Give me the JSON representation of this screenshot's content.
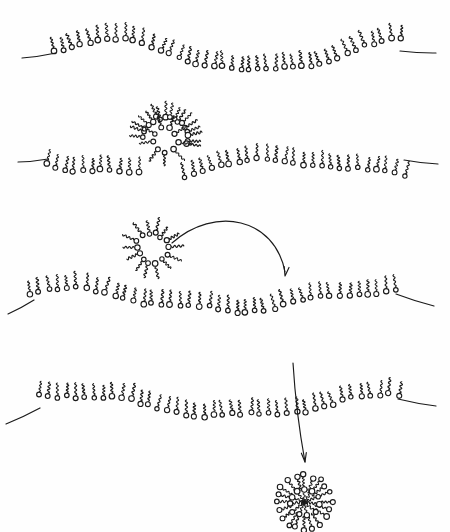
{
  "figure": {
    "type": "hand-drawn-schematic",
    "background_color": "#fefefe",
    "ink_color": "#1a1a1a",
    "width": 450,
    "height": 532,
    "panel_count": 4
  },
  "style": {
    "head_radius": 2.5,
    "tail_length": 11,
    "tail_wave_amplitude": 2.1,
    "tail_wave_count": 3,
    "stroke_width": 1.15,
    "end_line_width": 1.2
  },
  "panels": [
    {
      "name": "panel-1-undulating-monolayer",
      "label": "Undulating lipid monolayer",
      "membrane": {
        "name": "monolayer-1",
        "lipid_count": 40,
        "x_start": 54,
        "x_end": 400,
        "baseline": 56,
        "tails_up": true,
        "waves": [
          {
            "amp": -15,
            "phase": 0.45,
            "cycles": 1.15
          },
          {
            "amp": 3.0,
            "phase": 1.4,
            "cycles": 2.6
          }
        ],
        "left_end_line": {
          "x1": 22,
          "y1": 58,
          "x2": 56,
          "y2": 53
        },
        "right_end_line": {
          "x1": 400,
          "y1": 51,
          "x2": 436,
          "y2": 53
        }
      },
      "micelle": null,
      "arrow": null
    },
    {
      "name": "panel-2-micelle-inserting",
      "label": "Micelle splaying into the monolayer",
      "membrane": {
        "name": "monolayer-2",
        "lipid_count": 40,
        "x_start": 46,
        "x_end": 404,
        "baseline": 168,
        "tails_up": true,
        "waves": [
          {
            "amp": -7.5,
            "phase": 2.35,
            "cycles": 1.35
          },
          {
            "amp": 3.5,
            "phase": 0.7,
            "cycles": 2.9
          }
        ],
        "gap_from": 0.26,
        "gap_to": 0.36,
        "left_end_line": {
          "x1": 18,
          "y1": 162,
          "x2": 48,
          "y2": 159
        },
        "right_end_line": {
          "x1": 404,
          "y1": 160,
          "x2": 438,
          "y2": 164
        }
      },
      "micelle": {
        "name": "micelle-inserting",
        "shape": "splayed-wedge",
        "cx": 165,
        "cy": 140,
        "radius": 23,
        "lipid_count": 17,
        "heads_inward": true,
        "angle_start": -170,
        "angle_end": 10
      },
      "arrow": null
    },
    {
      "name": "panel-3-micelle-approaching",
      "label": "Free micelle with curved arrow toward monolayer",
      "membrane": {
        "name": "monolayer-3",
        "lipid_count": 40,
        "x_start": 30,
        "x_end": 396,
        "baseline": 300,
        "tails_up": true,
        "waves": [
          {
            "amp": -10,
            "phase": 1.15,
            "cycles": 1.05
          },
          {
            "amp": 3.0,
            "phase": 2.2,
            "cycles": 3.1
          }
        ],
        "left_end_line": {
          "x1": 8,
          "y1": 314,
          "x2": 34,
          "y2": 300
        },
        "right_end_line": {
          "x1": 396,
          "y1": 294,
          "x2": 434,
          "y2": 306
        }
      },
      "micelle": {
        "name": "micelle-free-upper",
        "shape": "radial",
        "cx": 152,
        "cy": 248,
        "radius": 15,
        "lipid_count": 14,
        "heads_inward": true,
        "angle_start": 0,
        "angle_end": 360
      },
      "arrow": {
        "name": "curved-arrow-micelle-to-membrane",
        "kind": "curved",
        "path": "M 172 243 C 215 205, 275 218, 285 272",
        "head_angle_deg": 100,
        "head_x": 285,
        "head_y": 276
      }
    },
    {
      "name": "panel-4-monolayer-shedding-micelle",
      "label": "Monolayer with downward arrow releasing a micelle",
      "membrane": {
        "name": "monolayer-4",
        "lipid_count": 40,
        "x_start": 38,
        "x_end": 398,
        "baseline": 405,
        "tails_up": true,
        "waves": [
          {
            "amp": -11,
            "phase": 1.3,
            "cycles": 1.0
          },
          {
            "amp": 2.6,
            "phase": 0.2,
            "cycles": 3.0
          }
        ],
        "left_end_line": {
          "x1": 6,
          "y1": 424,
          "x2": 40,
          "y2": 408
        },
        "right_end_line": {
          "x1": 398,
          "y1": 399,
          "x2": 436,
          "y2": 406
        }
      },
      "micelle": {
        "name": "micelle-free-lower",
        "shape": "radial",
        "cx": 304,
        "cy": 502,
        "radius": 27,
        "lipid_count": 20,
        "heads_inward": false,
        "angle_start": 0,
        "angle_end": 360
      },
      "arrow": {
        "name": "straight-arrow-membrane-to-micelle",
        "kind": "straight",
        "x1": 293,
        "y1": 363,
        "x2": 305,
        "y2": 462,
        "head_angle_deg": 83
      }
    }
  ]
}
